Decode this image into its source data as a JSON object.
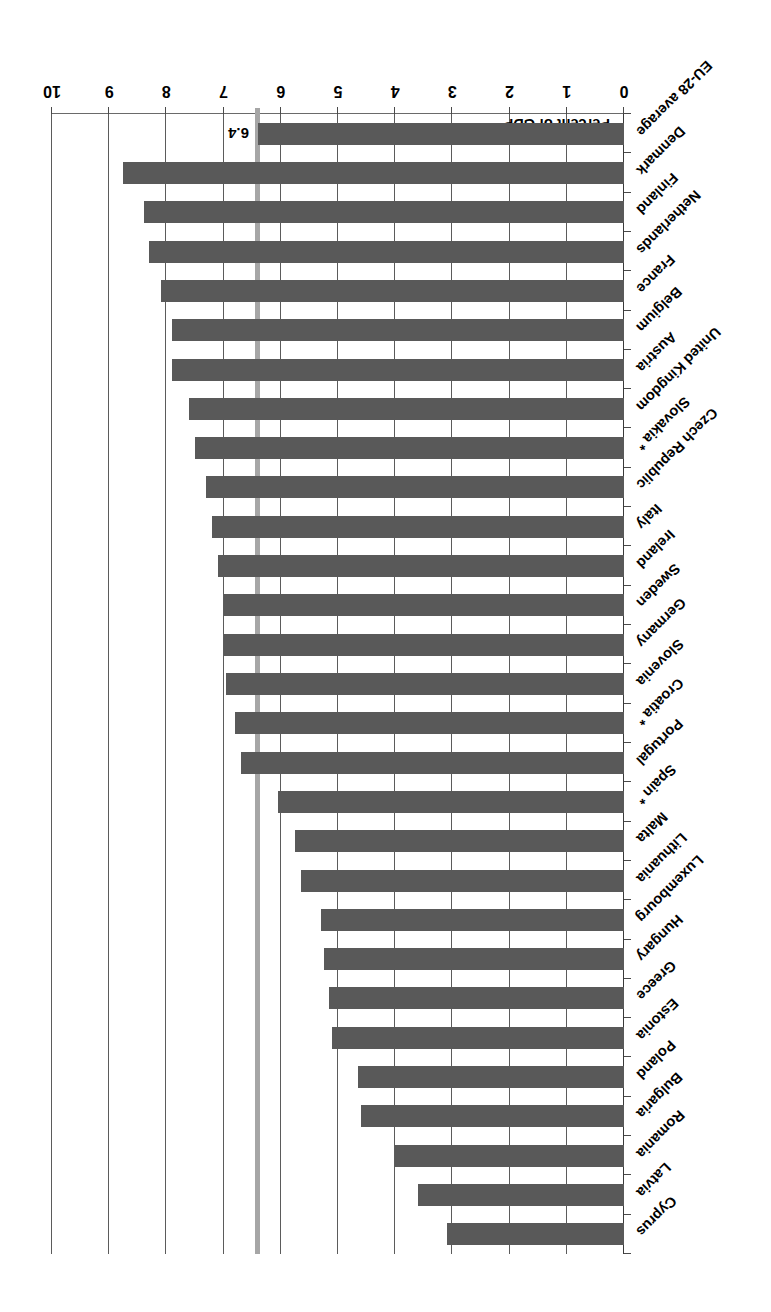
{
  "chart_data": {
    "type": "bar",
    "orientation": "horizontal",
    "title": "",
    "xlabel": "Percent of GDP",
    "ylabel": "",
    "xlim": [
      0,
      10
    ],
    "xticks": [
      "0",
      "1",
      "2",
      "3",
      "4",
      "5",
      "6",
      "7",
      "8",
      "9",
      "10"
    ],
    "grid": true,
    "legend": null,
    "categories": [
      "Cyprus",
      "Latvia",
      "Romania",
      "Bulgaria",
      "Poland",
      "Estonia",
      "Greece",
      "Hungary",
      "Luxembourg",
      "Lithuania",
      "Malta",
      "Spain *",
      "Portugal",
      "Croatia *",
      "Slovenia",
      "Germany",
      "Sweden",
      "Ireland",
      "Italy",
      "Czech Republic",
      "Slovakia *",
      "United Kingdom",
      "Austria",
      "Belgium",
      "France",
      "Netherlands",
      "Finland",
      "Denmark",
      "EU-28 average"
    ],
    "values": [
      3.1,
      3.6,
      4.0,
      4.6,
      4.65,
      5.1,
      5.15,
      5.25,
      5.3,
      5.65,
      5.75,
      6.05,
      6.7,
      6.8,
      6.95,
      7.0,
      7.0,
      7.1,
      7.2,
      7.3,
      7.5,
      7.6,
      7.9,
      7.9,
      8.1,
      8.3,
      8.4,
      8.75,
      6.4
    ],
    "annotations": [
      {
        "name": "eu-average-reference-line",
        "label": "6.4",
        "value": 6.4
      }
    ],
    "colors": {
      "bar": "#595959",
      "reference_line": "#a6a6a6",
      "gridline": "#5b5b5b",
      "text": "#000000",
      "background": "#ffffff"
    }
  }
}
